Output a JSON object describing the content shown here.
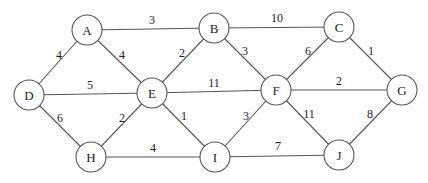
{
  "graph": {
    "type": "undirected-weighted",
    "node_radius": 15,
    "colors": {
      "stroke": "#555555",
      "text": "#222222",
      "background": "#ffffff"
    },
    "nodes": [
      {
        "id": "A",
        "label": "A",
        "x": 87,
        "y": 30
      },
      {
        "id": "B",
        "label": "B",
        "x": 214,
        "y": 28
      },
      {
        "id": "C",
        "label": "C",
        "x": 339,
        "y": 27
      },
      {
        "id": "D",
        "label": "D",
        "x": 29,
        "y": 95
      },
      {
        "id": "E",
        "label": "E",
        "x": 152,
        "y": 93
      },
      {
        "id": "F",
        "label": "F",
        "x": 276,
        "y": 90
      },
      {
        "id": "G",
        "label": "G",
        "x": 402,
        "y": 90
      },
      {
        "id": "H",
        "label": "H",
        "x": 91,
        "y": 157
      },
      {
        "id": "I",
        "label": "I",
        "x": 215,
        "y": 157
      },
      {
        "id": "J",
        "label": "J",
        "x": 339,
        "y": 155
      }
    ],
    "edges": [
      {
        "from": "A",
        "to": "B",
        "weight": "3",
        "lx": 152,
        "ly": 20
      },
      {
        "from": "B",
        "to": "C",
        "weight": "10",
        "lx": 277,
        "ly": 18
      },
      {
        "from": "A",
        "to": "D",
        "weight": "4",
        "lx": 59,
        "ly": 55
      },
      {
        "from": "A",
        "to": "E",
        "weight": "4",
        "lx": 122,
        "ly": 55
      },
      {
        "from": "B",
        "to": "E",
        "weight": "2",
        "lx": 182,
        "ly": 53
      },
      {
        "from": "B",
        "to": "F",
        "weight": "3",
        "lx": 245,
        "ly": 51
      },
      {
        "from": "C",
        "to": "F",
        "weight": "6",
        "lx": 308,
        "ly": 51
      },
      {
        "from": "C",
        "to": "G",
        "weight": "1",
        "lx": 371,
        "ly": 51
      },
      {
        "from": "D",
        "to": "E",
        "weight": "5",
        "lx": 90,
        "ly": 85
      },
      {
        "from": "E",
        "to": "F",
        "weight": "11",
        "lx": 214,
        "ly": 83
      },
      {
        "from": "F",
        "to": "G",
        "weight": "2",
        "lx": 339,
        "ly": 81
      },
      {
        "from": "D",
        "to": "H",
        "weight": "6",
        "lx": 60,
        "ly": 118
      },
      {
        "from": "E",
        "to": "H",
        "weight": "2",
        "lx": 122,
        "ly": 118
      },
      {
        "from": "E",
        "to": "I",
        "weight": "1",
        "lx": 184,
        "ly": 116
      },
      {
        "from": "F",
        "to": "I",
        "weight": "3",
        "lx": 246,
        "ly": 116
      },
      {
        "from": "F",
        "to": "J",
        "weight": "11",
        "lx": 309,
        "ly": 114
      },
      {
        "from": "G",
        "to": "J",
        "weight": "8",
        "lx": 370,
        "ly": 114
      },
      {
        "from": "H",
        "to": "I",
        "weight": "4",
        "lx": 153,
        "ly": 148
      },
      {
        "from": "I",
        "to": "J",
        "weight": "7",
        "lx": 278,
        "ly": 146
      }
    ]
  }
}
